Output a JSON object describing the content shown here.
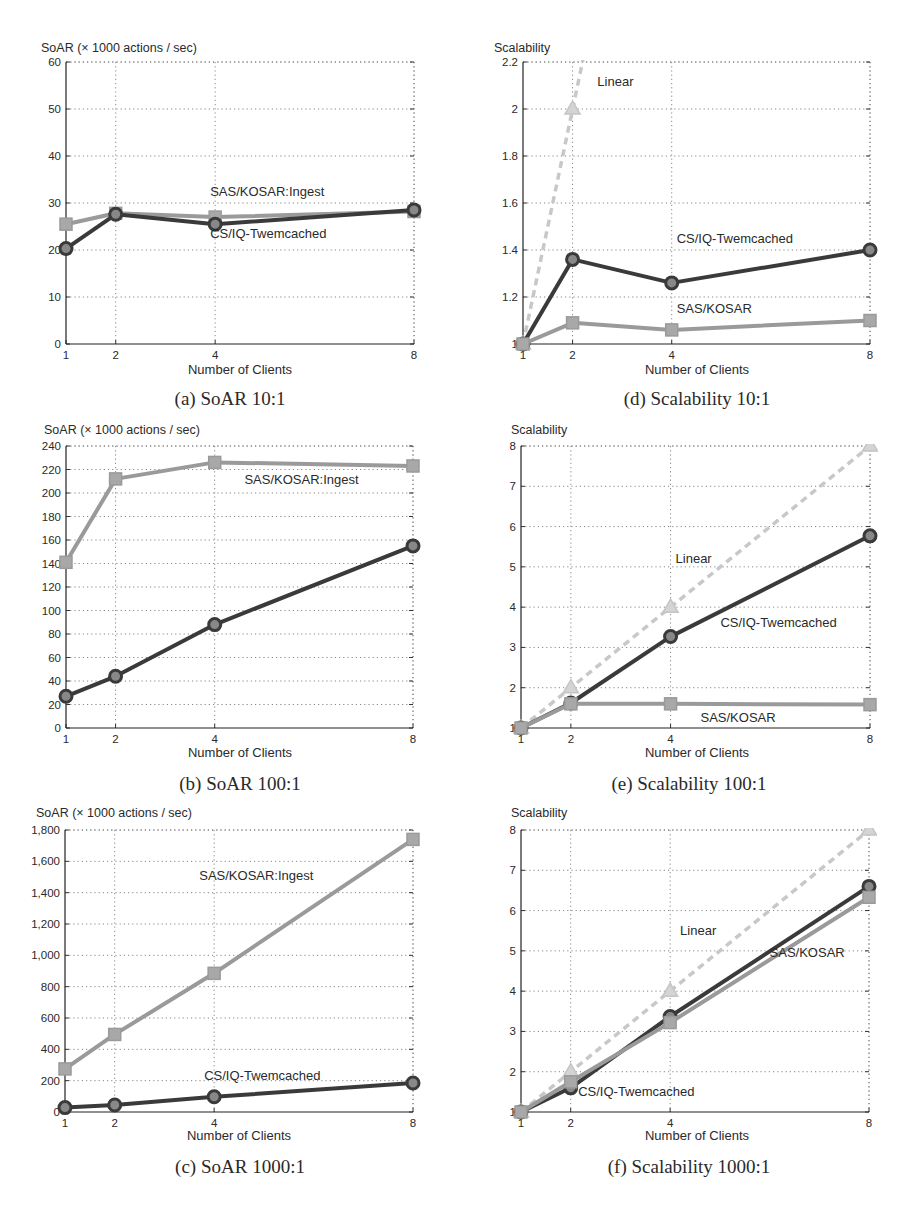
{
  "chart_data": [
    {
      "id": "a",
      "type": "line",
      "caption": "(a) SoAR 10:1",
      "title": "",
      "xlabel": "Number of Clients",
      "ylabel": "SoAR (× 1000 actions / sec)",
      "x": [
        1,
        2,
        4,
        8
      ],
      "x_ticks": [
        "1",
        "2",
        "4",
        "8"
      ],
      "y_ticks": [
        "0",
        "10",
        "20",
        "30",
        "40",
        "50",
        "60"
      ],
      "ylim": [
        0,
        60
      ],
      "grid": true,
      "series": [
        {
          "name": "SAS/KOSAR:Ingest",
          "marker": "square",
          "style": "solid",
          "color": "#9a9a9a",
          "values": [
            25.5,
            27.8,
            27.0,
            28.2
          ]
        },
        {
          "name": "CS/IQ-Twemcached",
          "marker": "circle",
          "style": "solid",
          "color": "#3a3a3a",
          "values": [
            20.3,
            27.6,
            25.5,
            28.5
          ]
        }
      ],
      "annotations": [
        {
          "text": "SAS/KOSAR:Ingest",
          "x": 3.9,
          "y": 31.5
        },
        {
          "text": "CS/IQ-Twemcached",
          "x": 3.9,
          "y": 22.5
        }
      ]
    },
    {
      "id": "d",
      "type": "line",
      "caption": "(d) Scalability 10:1",
      "title": "",
      "xlabel": "Number of Clients",
      "ylabel": "Scalability",
      "x": [
        1,
        2,
        4,
        8
      ],
      "x_ticks": [
        "1",
        "2",
        "4",
        "8"
      ],
      "y_ticks": [
        "1",
        "1.2",
        "1.4",
        "1.6",
        "1.8",
        "2",
        "2.2"
      ],
      "ylim": [
        1,
        2.2
      ],
      "grid": true,
      "series": [
        {
          "name": "Linear",
          "marker": "triangle",
          "style": "dashed",
          "color": "#c8c8c8",
          "values": [
            1,
            2,
            4,
            8
          ]
        },
        {
          "name": "CS/IQ-Twemcached",
          "marker": "circle",
          "style": "solid",
          "color": "#3a3a3a",
          "values": [
            1.0,
            1.36,
            1.26,
            1.4
          ]
        },
        {
          "name": "SAS/KOSAR",
          "marker": "square",
          "style": "solid",
          "color": "#9a9a9a",
          "values": [
            1.0,
            1.09,
            1.06,
            1.1
          ]
        }
      ],
      "annotations": [
        {
          "text": "Linear",
          "x": 2.5,
          "y": 2.1
        },
        {
          "text": "CS/IQ-Twemcached",
          "x": 4.1,
          "y": 1.43
        },
        {
          "text": "SAS/KOSAR",
          "x": 4.1,
          "y": 1.13
        }
      ]
    },
    {
      "id": "b",
      "type": "line",
      "caption": "(b) SoAR 100:1",
      "title": "",
      "xlabel": "Number of Clients",
      "ylabel": "SoAR (× 1000 actions / sec)",
      "x": [
        1,
        2,
        4,
        8
      ],
      "x_ticks": [
        "1",
        "2",
        "4",
        "8"
      ],
      "y_ticks": [
        "0",
        "20",
        "40",
        "60",
        "80",
        "100",
        "120",
        "140",
        "160",
        "180",
        "200",
        "220",
        "240"
      ],
      "ylim": [
        0,
        240
      ],
      "grid": true,
      "series": [
        {
          "name": "SAS/KOSAR:Ingest",
          "marker": "square",
          "style": "solid",
          "color": "#9a9a9a",
          "values": [
            141,
            212,
            226,
            223
          ]
        },
        {
          "name": "CS/IQ-Twemcached",
          "marker": "circle",
          "style": "solid",
          "color": "#3a3a3a",
          "values": [
            27,
            44,
            88,
            155
          ]
        }
      ],
      "annotations": [
        {
          "text": "SAS/KOSAR:Ingest",
          "x": 4.6,
          "y": 208
        }
      ]
    },
    {
      "id": "e",
      "type": "line",
      "caption": "(e) Scalability 100:1",
      "title": "",
      "xlabel": "Number of Clients",
      "ylabel": "Scalability",
      "x": [
        1,
        2,
        4,
        8
      ],
      "x_ticks": [
        "1",
        "2",
        "4",
        "8"
      ],
      "y_ticks": [
        "1",
        "2",
        "3",
        "4",
        "5",
        "6",
        "7",
        "8"
      ],
      "ylim": [
        1,
        8
      ],
      "grid": true,
      "series": [
        {
          "name": "Linear",
          "marker": "triangle",
          "style": "dashed",
          "color": "#c8c8c8",
          "values": [
            1,
            2,
            4,
            8
          ]
        },
        {
          "name": "CS/IQ-Twemcached",
          "marker": "circle",
          "style": "solid",
          "color": "#3a3a3a",
          "values": [
            1.0,
            1.62,
            3.27,
            5.77
          ]
        },
        {
          "name": "SAS/KOSAR",
          "marker": "square",
          "style": "solid",
          "color": "#9a9a9a",
          "values": [
            1.0,
            1.6,
            1.6,
            1.58
          ]
        }
      ],
      "annotations": [
        {
          "text": "Linear",
          "x": 4.1,
          "y": 5.1
        },
        {
          "text": "CS/IQ-Twemcached",
          "x": 5.0,
          "y": 3.5
        },
        {
          "text": "SAS/KOSAR",
          "x": 4.6,
          "y": 1.15
        }
      ]
    },
    {
      "id": "c",
      "type": "line",
      "caption": "(c) SoAR 1000:1",
      "title": "",
      "xlabel": "Number of Clients",
      "ylabel": "SoAR (× 1000 actions / sec)",
      "x": [
        1,
        2,
        4,
        8
      ],
      "x_ticks": [
        "1",
        "2",
        "4",
        "8"
      ],
      "y_ticks": [
        "0",
        "200",
        "400",
        "600",
        "800",
        "1,000",
        "1,200",
        "1,400",
        "1,600",
        "1,800"
      ],
      "ylim": [
        0,
        1800
      ],
      "grid": true,
      "series": [
        {
          "name": "SAS/KOSAR:Ingest",
          "marker": "square",
          "style": "solid",
          "color": "#9a9a9a",
          "values": [
            275,
            495,
            885,
            1740
          ]
        },
        {
          "name": "CS/IQ-Twemcached",
          "marker": "circle",
          "style": "solid",
          "color": "#3a3a3a",
          "values": [
            28,
            45,
            97,
            185
          ]
        }
      ],
      "annotations": [
        {
          "text": "SAS/KOSAR:Ingest",
          "x": 3.7,
          "y": 1480
        },
        {
          "text": "CS/IQ-Twemcached",
          "x": 3.8,
          "y": 205
        }
      ]
    },
    {
      "id": "f",
      "type": "line",
      "caption": "(f) Scalability 1000:1",
      "title": "",
      "xlabel": "Number of Clients",
      "ylabel": "Scalability",
      "x": [
        1,
        2,
        4,
        8
      ],
      "x_ticks": [
        "1",
        "2",
        "4",
        "8"
      ],
      "y_ticks": [
        "1",
        "2",
        "3",
        "4",
        "5",
        "6",
        "7",
        "8"
      ],
      "ylim": [
        1,
        8
      ],
      "grid": true,
      "series": [
        {
          "name": "Linear",
          "marker": "triangle",
          "style": "dashed",
          "color": "#c8c8c8",
          "values": [
            1,
            2,
            4,
            8
          ]
        },
        {
          "name": "CS/IQ-Twemcached",
          "marker": "circle",
          "style": "solid",
          "color": "#3a3a3a",
          "values": [
            1.0,
            1.6,
            3.37,
            6.6
          ]
        },
        {
          "name": "SAS/KOSAR",
          "marker": "square",
          "style": "solid",
          "color": "#9a9a9a",
          "values": [
            1.0,
            1.75,
            3.22,
            6.33
          ]
        }
      ],
      "annotations": [
        {
          "text": "Linear",
          "x": 4.2,
          "y": 5.4
        },
        {
          "text": "SAS/KOSAR",
          "x": 6.0,
          "y": 4.85
        },
        {
          "text": "CS/IQ-Twemcached",
          "x": 2.15,
          "y": 1.4
        }
      ]
    }
  ]
}
